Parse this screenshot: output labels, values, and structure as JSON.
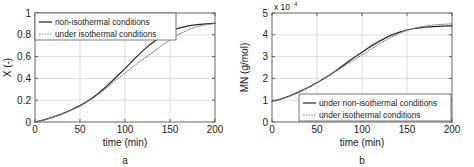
{
  "figure": {
    "background": "#ffffff",
    "panels": [
      {
        "id": "a",
        "label": "a",
        "chart_data": {
          "type": "line",
          "title": "",
          "xlabel": "time (min)",
          "ylabel": "X (-)",
          "xlim": [
            0,
            200
          ],
          "ylim": [
            0,
            1
          ],
          "xticks": [
            0,
            50,
            100,
            150,
            200
          ],
          "yticks": [
            0,
            0.2,
            0.4,
            0.6,
            0.8,
            1
          ],
          "ytick_labels": [
            "0",
            "0.2",
            "0.4",
            "0.6",
            "0.8",
            "1"
          ],
          "xtick_labels": [
            "0",
            "50",
            "100",
            "150",
            "200"
          ],
          "grid": true,
          "legend_position": "top-left",
          "series": [
            {
              "name": "non-isothermal conditions",
              "style": "solid",
              "color": "#2b2b2b",
              "x": [
                0,
                10,
                20,
                30,
                40,
                50,
                60,
                70,
                80,
                90,
                100,
                110,
                120,
                130,
                140,
                150,
                160,
                170,
                180,
                190,
                200
              ],
              "values": [
                0.0,
                0.02,
                0.045,
                0.075,
                0.11,
                0.15,
                0.2,
                0.26,
                0.33,
                0.41,
                0.49,
                0.575,
                0.655,
                0.725,
                0.785,
                0.83,
                0.862,
                0.882,
                0.894,
                0.901,
                0.906
              ]
            },
            {
              "name": "under isothermal conditions",
              "style": "dotted",
              "color": "#7d7d7d",
              "x": [
                0,
                10,
                20,
                30,
                40,
                50,
                60,
                70,
                80,
                90,
                100,
                110,
                120,
                130,
                140,
                150,
                160,
                170,
                180,
                190,
                200
              ],
              "values": [
                0.0,
                0.018,
                0.042,
                0.072,
                0.105,
                0.145,
                0.195,
                0.25,
                0.315,
                0.385,
                0.45,
                0.515,
                0.575,
                0.635,
                0.695,
                0.755,
                0.805,
                0.845,
                0.875,
                0.893,
                0.902
              ]
            }
          ]
        }
      },
      {
        "id": "b",
        "label": "b",
        "chart_data": {
          "type": "line",
          "title": "",
          "xlabel": "time (min)",
          "ylabel": "MN (g/mol)",
          "y_multiplier_base": "x 10",
          "y_multiplier_exponent": "4",
          "xlim": [
            0,
            200
          ],
          "ylim": [
            0,
            5
          ],
          "xticks": [
            0,
            50,
            100,
            150,
            200
          ],
          "yticks": [
            0,
            1,
            2,
            3,
            4,
            5
          ],
          "ytick_labels": [
            "0",
            "1",
            "2",
            "3",
            "4",
            "5"
          ],
          "xtick_labels": [
            "0",
            "50",
            "100",
            "150",
            "200"
          ],
          "grid": true,
          "legend_position": "bottom-right",
          "series": [
            {
              "name": "under non-isothermal conditions",
              "style": "solid",
              "color": "#2b2b2b",
              "x": [
                0,
                10,
                20,
                30,
                40,
                50,
                60,
                70,
                80,
                90,
                100,
                110,
                120,
                130,
                140,
                150,
                160,
                170,
                180,
                190,
                200
              ],
              "values": [
                0.95,
                1.05,
                1.2,
                1.38,
                1.58,
                1.8,
                2.05,
                2.32,
                2.62,
                2.92,
                3.2,
                3.48,
                3.72,
                3.94,
                4.1,
                4.22,
                4.3,
                4.35,
                4.38,
                4.4,
                4.41
              ]
            },
            {
              "name": "under isothermal conditions",
              "style": "dotted",
              "color": "#7d7d7d",
              "x": [
                0,
                10,
                20,
                30,
                40,
                50,
                60,
                70,
                80,
                90,
                100,
                110,
                120,
                130,
                140,
                150,
                160,
                170,
                180,
                190,
                200
              ],
              "values": [
                0.95,
                1.05,
                1.19,
                1.36,
                1.56,
                1.79,
                2.04,
                2.3,
                2.56,
                2.82,
                3.08,
                3.34,
                3.6,
                3.84,
                4.04,
                4.2,
                4.32,
                4.4,
                4.45,
                4.48,
                4.5
              ]
            }
          ]
        }
      }
    ]
  }
}
